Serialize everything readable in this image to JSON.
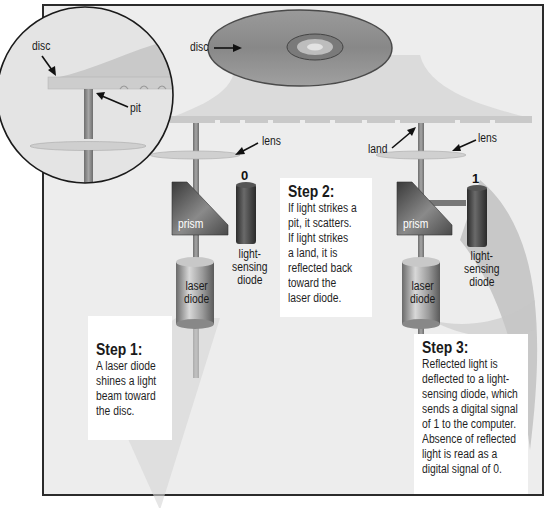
{
  "diagram": {
    "colors": {
      "frame_border": "#2b2b2b",
      "background": "#ededed",
      "disc": "#8f8f8f",
      "beam": "#8a8a8a",
      "prism": "#5a5a5a",
      "diode_dark": "#444444",
      "laser_diode": "#a8a8a8",
      "step_box": "#ffffff"
    },
    "labels": {
      "disc_main": "disc",
      "disc_zoom": "disc",
      "pit": "pit",
      "lens_left": "lens",
      "lens_right": "lens",
      "land": "land",
      "prism_left": "prism",
      "prism_right": "prism",
      "laser_diode_left": [
        "laser",
        "diode"
      ],
      "laser_diode_right": [
        "laser",
        "diode"
      ],
      "sensing_diode_left": [
        "light-",
        "sensing",
        "diode"
      ],
      "sensing_diode_right": [
        "light-",
        "sensing",
        "diode"
      ],
      "signal_left": "0",
      "signal_right": "1"
    },
    "steps": [
      {
        "title": "Step 1:",
        "body": "A laser diode\nshines a light\nbeam toward\nthe disc."
      },
      {
        "title": "Step 2:",
        "body": "If light strikes a\npit, it scatters.\nIf light strikes\na land, it is\nreflected back\ntoward the\nlaser diode."
      },
      {
        "title": "Step 3:",
        "body": "Reflected light is\ndeflected to a light-\nsensing diode, which\nsends a digital signal\nof 1 to the computer.\nAbsence of reflected\nlight is read as a\ndigital signal of 0."
      }
    ]
  }
}
